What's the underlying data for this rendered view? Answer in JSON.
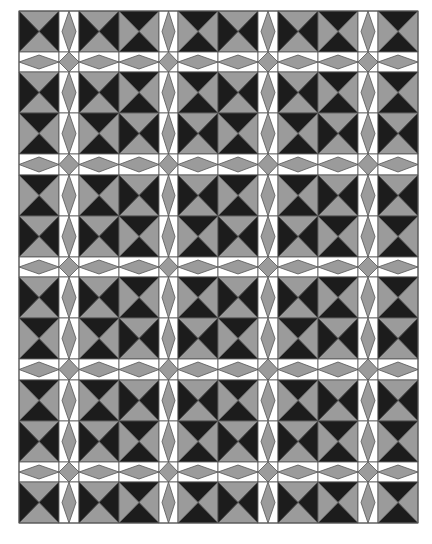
{
  "title": "Hourglass quilt pattern with diamond sashing",
  "colors": {
    "background": "#ffffff",
    "gray": "#9b9b9b",
    "black": "#1c1c1c",
    "sash": "#ffffff",
    "outline": "#555555"
  },
  "quilt": {
    "left": 19,
    "top": 11,
    "right": 418,
    "bottom": 523,
    "columns": [
      {
        "kind": "block",
        "x0": 19,
        "x1": 59
      },
      {
        "kind": "sash",
        "x0": 59,
        "x1": 79
      },
      {
        "kind": "block",
        "x0": 79,
        "x1": 119
      },
      {
        "kind": "block",
        "x0": 119,
        "x1": 159
      },
      {
        "kind": "sash",
        "x0": 159,
        "x1": 178
      },
      {
        "kind": "block",
        "x0": 178,
        "x1": 218
      },
      {
        "kind": "block",
        "x0": 218,
        "x1": 258
      },
      {
        "kind": "sash",
        "x0": 258,
        "x1": 278
      },
      {
        "kind": "block",
        "x0": 278,
        "x1": 318
      },
      {
        "kind": "block",
        "x0": 318,
        "x1": 358
      },
      {
        "kind": "sash",
        "x0": 358,
        "x1": 378
      },
      {
        "kind": "block",
        "x0": 378,
        "x1": 418
      }
    ],
    "rows": [
      {
        "kind": "block",
        "y0": 11,
        "y1": 52
      },
      {
        "kind": "sash",
        "y0": 52,
        "y1": 72
      },
      {
        "kind": "block",
        "y0": 72,
        "y1": 113
      },
      {
        "kind": "block",
        "y0": 113,
        "y1": 154
      },
      {
        "kind": "sash",
        "y0": 154,
        "y1": 175
      },
      {
        "kind": "block",
        "y0": 175,
        "y1": 216
      },
      {
        "kind": "block",
        "y0": 216,
        "y1": 257
      },
      {
        "kind": "sash",
        "y0": 257,
        "y1": 277
      },
      {
        "kind": "block",
        "y0": 277,
        "y1": 318
      },
      {
        "kind": "block",
        "y0": 318,
        "y1": 359
      },
      {
        "kind": "sash",
        "y0": 359,
        "y1": 380
      },
      {
        "kind": "block",
        "y0": 380,
        "y1": 421
      },
      {
        "kind": "block",
        "y0": 421,
        "y1": 462
      },
      {
        "kind": "sash",
        "y0": 462,
        "y1": 482
      },
      {
        "kind": "block",
        "y0": 482,
        "y1": 523
      }
    ],
    "block_types_legend": {
      "A": "top & bottom triangles gray, left & right triangles black",
      "B": "top & bottom triangles black, left & right triangles gray"
    },
    "blocks": [
      [
        "A",
        "A",
        "B",
        "B",
        "A",
        "A",
        "B",
        "B"
      ],
      [
        "A",
        "A",
        "B",
        "B",
        "A",
        "A",
        "B",
        "B"
      ],
      [
        "B",
        "B",
        "A",
        "A",
        "B",
        "B",
        "A",
        "A"
      ],
      [
        "B",
        "B",
        "A",
        "A",
        "B",
        "B",
        "A",
        "A"
      ],
      [
        "A",
        "A",
        "B",
        "B",
        "A",
        "A",
        "B",
        "B"
      ],
      [
        "A",
        "A",
        "B",
        "B",
        "A",
        "A",
        "B",
        "B"
      ],
      [
        "B",
        "B",
        "A",
        "A",
        "B",
        "B",
        "A",
        "A"
      ],
      [
        "B",
        "B",
        "A",
        "A",
        "B",
        "B",
        "A",
        "A"
      ],
      [
        "A",
        "A",
        "B",
        "B",
        "A",
        "A",
        "B",
        "B"
      ],
      [
        "A",
        "A",
        "B",
        "B",
        "A",
        "A",
        "B",
        "B"
      ]
    ]
  }
}
